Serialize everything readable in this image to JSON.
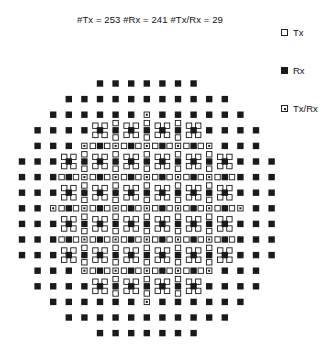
{
  "title": "#Tx = 253  #Rx = 241  #Tx/Rx = 29",
  "legend": [
    {
      "label": "Tx",
      "type": "tx",
      "icon": "open-square-icon"
    },
    {
      "label": "Rx",
      "type": "rx",
      "icon": "filled-square-icon"
    },
    {
      "label": "Tx/Rx",
      "type": "txrx",
      "icon": "dotted-square-icon"
    }
  ],
  "counts": {
    "tx": 253,
    "rx": 241,
    "txrx": 29
  },
  "grid": {
    "rows": 17,
    "cols": 17,
    "outer_extent": [
      [
        5,
        11
      ],
      [
        3,
        13
      ],
      [
        2,
        14
      ],
      [
        1,
        15
      ],
      [
        1,
        15
      ],
      [
        0,
        16
      ],
      [
        0,
        16
      ],
      [
        0,
        16
      ],
      [
        0,
        16
      ],
      [
        0,
        16
      ],
      [
        0,
        16
      ],
      [
        0,
        16
      ],
      [
        1,
        15
      ],
      [
        1,
        15
      ],
      [
        2,
        14
      ],
      [
        3,
        13
      ],
      [
        5,
        11
      ]
    ],
    "inner_extent": [
      null,
      null,
      null,
      [
        5,
        11
      ],
      [
        4,
        12
      ],
      [
        3,
        13
      ],
      [
        3,
        13
      ],
      [
        3,
        13
      ],
      [
        2,
        14
      ],
      [
        3,
        13
      ],
      [
        3,
        13
      ],
      [
        3,
        13
      ],
      [
        4,
        12
      ],
      [
        5,
        11
      ],
      null,
      null,
      null
    ],
    "single_txrx": [
      [
        2,
        8
      ],
      [
        14,
        8
      ]
    ]
  },
  "colors": {
    "ink": "#1a1a1a",
    "background": "#ffffff"
  }
}
